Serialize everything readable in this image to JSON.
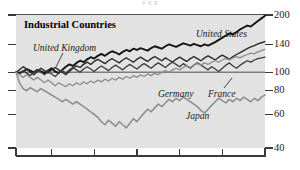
{
  "figure": {
    "cropped_header": "p  g  g",
    "panel_title": "Industrial Countries",
    "background_color": "#e2e2e2",
    "page_color": "#ffffff"
  },
  "chart_data": {
    "type": "line",
    "title": "Industrial Countries",
    "xlabel": "",
    "ylabel": "",
    "scale": "log",
    "ylim": [
      40,
      200
    ],
    "yticks": [
      40,
      60,
      80,
      100,
      140,
      200
    ],
    "ytick_labels": [
      "40",
      "60",
      "80",
      "100",
      "140",
      "200"
    ],
    "reference_line": 100,
    "grid": false,
    "legend": "inline-annotations",
    "x": [
      0,
      1,
      2,
      3,
      4,
      5,
      6,
      7,
      8,
      9,
      10,
      11,
      12,
      13,
      14,
      15,
      16,
      17,
      18,
      19,
      20,
      21,
      22,
      23,
      24,
      25,
      26,
      27,
      28,
      29,
      30,
      31,
      32,
      33,
      34,
      35,
      36,
      37,
      38,
      39,
      40,
      41,
      42,
      43,
      44,
      45,
      46,
      47,
      48,
      49,
      50,
      51,
      52,
      53,
      54,
      55,
      56,
      57,
      58,
      59,
      60,
      61,
      62,
      63,
      64,
      65,
      66,
      67,
      68,
      69,
      70
    ],
    "xticks_positions": [
      0,
      10,
      22,
      34,
      46,
      58,
      70
    ],
    "xtick_labels": [
      "",
      "",
      "",
      "",
      "",
      "",
      ""
    ],
    "series": [
      {
        "name": "United States",
        "color": "#141414",
        "width": 1.9,
        "label_x": 196,
        "label_y": 30,
        "values": [
          100,
          99,
          101,
          104,
          102,
          100,
          103,
          101,
          99,
          102,
          105,
          101,
          99,
          103,
          107,
          110,
          108,
          112,
          115,
          113,
          117,
          120,
          118,
          122,
          125,
          122,
          126,
          129,
          127,
          124,
          128,
          131,
          129,
          133,
          131,
          134,
          132,
          130,
          134,
          137,
          135,
          133,
          137,
          140,
          138,
          136,
          139,
          142,
          140,
          138,
          141,
          139,
          137,
          140,
          138,
          141,
          144,
          148,
          152,
          156,
          160,
          158,
          163,
          168,
          172,
          176,
          174,
          180,
          186,
          192,
          198
        ]
      },
      {
        "name": "United Kingdom",
        "color": "#2a2a2a",
        "width": 1.4,
        "label_x": 33,
        "label_y": 44,
        "leader": [
          [
            63,
            53
          ],
          [
            56,
            67
          ]
        ],
        "values": [
          100,
          103,
          107,
          104,
          100,
          97,
          101,
          105,
          102,
          99,
          103,
          106,
          103,
          100,
          97,
          101,
          105,
          108,
          106,
          110,
          113,
          110,
          114,
          117,
          114,
          111,
          115,
          118,
          115,
          112,
          116,
          119,
          116,
          113,
          117,
          120,
          117,
          114,
          118,
          121,
          118,
          115,
          119,
          116,
          113,
          117,
          120,
          117,
          114,
          118,
          121,
          118,
          115,
          119,
          122,
          119,
          116,
          120,
          123,
          120,
          117,
          121,
          124,
          127,
          130,
          133,
          136,
          138,
          141,
          143,
          145
        ]
      },
      {
        "name": "France",
        "color": "#3c3c3c",
        "width": 1.3,
        "label_x": 208,
        "label_y": 90,
        "leader": [
          [
            224,
            88
          ],
          [
            232,
            78
          ]
        ],
        "values": [
          100,
          98,
          102,
          99,
          96,
          100,
          103,
          100,
          97,
          101,
          98,
          95,
          99,
          102,
          99,
          103,
          106,
          103,
          100,
          104,
          107,
          104,
          101,
          105,
          108,
          105,
          102,
          106,
          109,
          106,
          103,
          107,
          110,
          107,
          104,
          108,
          111,
          108,
          105,
          109,
          112,
          109,
          106,
          110,
          113,
          110,
          107,
          111,
          108,
          105,
          109,
          112,
          109,
          106,
          103,
          107,
          104,
          101,
          105,
          109,
          112,
          108,
          105,
          109,
          112,
          115,
          113,
          116,
          118,
          119,
          120
        ]
      },
      {
        "name": "Germany",
        "color": "#8c8c8c",
        "width": 1.3,
        "label_x": 158,
        "label_y": 90,
        "values": [
          100,
          97,
          94,
          97,
          94,
          91,
          94,
          91,
          88,
          91,
          88,
          85,
          88,
          86,
          84,
          87,
          85,
          88,
          86,
          89,
          87,
          90,
          88,
          91,
          89,
          92,
          90,
          93,
          91,
          94,
          92,
          95,
          93,
          96,
          94,
          97,
          95,
          98,
          96,
          99,
          97,
          100,
          102,
          100,
          103,
          105,
          103,
          106,
          108,
          106,
          109,
          111,
          109,
          112,
          110,
          113,
          115,
          113,
          116,
          118,
          116,
          119,
          121,
          119,
          122,
          124,
          126,
          125,
          128,
          130,
          132
        ]
      },
      {
        "name": "Japan",
        "color": "#909090",
        "width": 1.6,
        "label_x": 186,
        "label_y": 112,
        "values": [
          100,
          88,
          82,
          80,
          83,
          81,
          79,
          82,
          80,
          78,
          76,
          74,
          72,
          70,
          72,
          70,
          68,
          70,
          68,
          66,
          64,
          62,
          60,
          58,
          55,
          53,
          56,
          54,
          52,
          55,
          53,
          51,
          54,
          57,
          55,
          58,
          61,
          64,
          62,
          65,
          68,
          66,
          69,
          72,
          70,
          73,
          71,
          74,
          72,
          70,
          68,
          66,
          63,
          61,
          64,
          67,
          70,
          73,
          71,
          69,
          72,
          70,
          73,
          71,
          74,
          72,
          70,
          73,
          71,
          74,
          76
        ]
      }
    ]
  },
  "annotations": {
    "panel_label": "Industrial Countries",
    "series_labels": [
      "United States",
      "United Kingdom",
      "Germany",
      "France",
      "Japan"
    ]
  }
}
